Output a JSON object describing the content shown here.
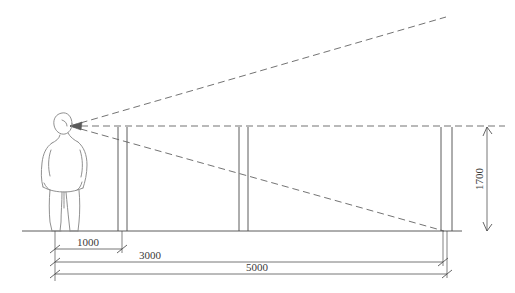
{
  "diagram": {
    "type": "technical-elevation-drawing",
    "units": "mm",
    "canvas": {
      "width": 515,
      "height": 293
    },
    "colors": {
      "line": "#4a4a4a",
      "dashed": "#5a5a5a",
      "figure": "#777777",
      "text": "#3a3a3a",
      "background": "#ffffff"
    }
  },
  "eye_point": {
    "label": "eye-point",
    "x": 70,
    "y": 126
  },
  "ground_line": {
    "label": "ground-line",
    "x1": 22,
    "x2": 462,
    "y": 231
  },
  "posts": [
    {
      "name": "post-1",
      "x_left": 118,
      "x_right": 127,
      "y_top": 127,
      "y_bottom": 231
    },
    {
      "name": "post-2",
      "x_left": 239,
      "x_right": 248,
      "y_top": 127,
      "y_bottom": 231
    },
    {
      "name": "post-3",
      "x_left": 441,
      "x_right": 452,
      "y_top": 127,
      "y_bottom": 231
    }
  ],
  "sight_lines": [
    {
      "name": "upper-sight-line",
      "style": "dashed",
      "x1": 70,
      "y1": 126,
      "x2": 446,
      "y2": 17
    },
    {
      "name": "horizontal-sight-line",
      "style": "dashed",
      "x1": 70,
      "y1": 126,
      "x2": 505,
      "y2": 126
    },
    {
      "name": "lower-sight-line",
      "style": "dashed",
      "x1": 70,
      "y1": 126,
      "x2": 444,
      "y2": 231
    }
  ],
  "dimensions": {
    "horizontal": [
      {
        "name": "dimension-1000",
        "value": "1000",
        "x1": 55,
        "x2": 122,
        "y": 249,
        "text_x": 88,
        "text_y": 245
      },
      {
        "name": "dimension-3000",
        "value": "3000",
        "x1": 55,
        "x2": 443,
        "y": 262,
        "text_x": 150,
        "text_y": 258
      },
      {
        "name": "dimension-5000",
        "value": "5000",
        "x1": 55,
        "x2": 447,
        "y": 274,
        "text_x": 257,
        "text_y": 270
      }
    ],
    "vertical": [
      {
        "name": "dimension-1700",
        "value": "1700",
        "x": 487,
        "y1": 127,
        "y2": 231,
        "text_x": 483,
        "text_y": 179
      }
    ]
  },
  "figure": {
    "name": "human-figure-silhouette"
  }
}
